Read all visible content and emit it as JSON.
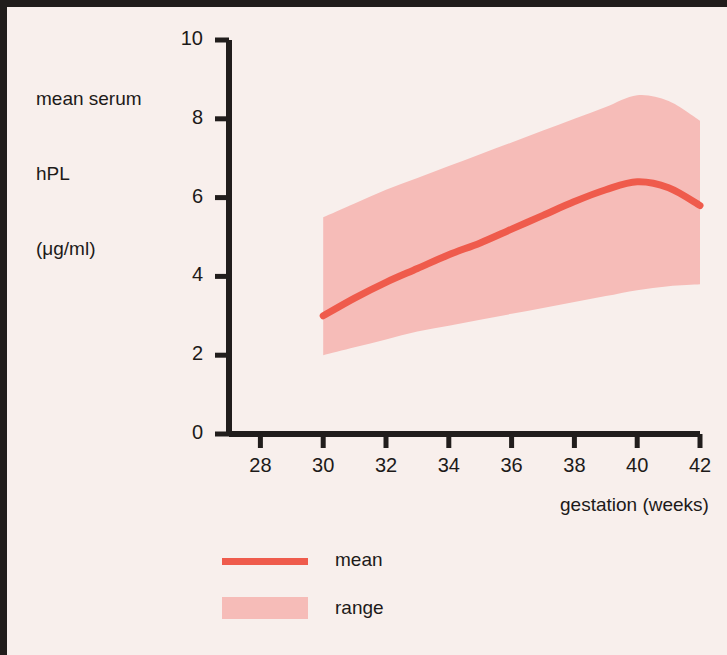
{
  "figure": {
    "background_color": "#f8efec",
    "border_color": "#211d1c"
  },
  "axes": {
    "y_title_line1": "mean serum",
    "y_title_line2": "hPL",
    "y_title_line3": "(μg/ml)",
    "x_title": "gestation (weeks)",
    "y_ticks": [
      "0",
      "2",
      "4",
      "6",
      "8",
      "10"
    ],
    "x_ticks": [
      "28",
      "30",
      "32",
      "34",
      "36",
      "38",
      "40",
      "42"
    ]
  },
  "legend": {
    "mean_label": "mean",
    "range_label": "range",
    "mean_color": "#ef5b4c",
    "range_color": "#f6bcb8"
  },
  "chart_data": {
    "type": "line",
    "title": "",
    "subtitle": "",
    "xlabel": "gestation (weeks)",
    "ylabel": "mean serum hPL (μg/ml)",
    "xlim": [
      27,
      42
    ],
    "ylim": [
      0,
      10
    ],
    "xticks": [
      28,
      30,
      32,
      34,
      36,
      38,
      40,
      42
    ],
    "yticks": [
      0,
      2,
      4,
      6,
      8,
      10
    ],
    "grid": false,
    "legend_position": "below-axes-left",
    "x": [
      30,
      31,
      32,
      33,
      34,
      35,
      36,
      37,
      38,
      39,
      40,
      41,
      42
    ],
    "series": [
      {
        "name": "mean",
        "color": "#ef5b4c",
        "type": "line",
        "values": [
          3.0,
          3.45,
          3.85,
          4.2,
          4.55,
          4.85,
          5.2,
          5.55,
          5.9,
          6.2,
          6.4,
          6.25,
          5.8
        ]
      },
      {
        "name": "range",
        "color": "#f6bcb8",
        "type": "band",
        "upper": [
          5.5,
          5.85,
          6.2,
          6.5,
          6.8,
          7.1,
          7.4,
          7.7,
          8.0,
          8.3,
          8.6,
          8.45,
          7.95
        ],
        "lower": [
          2.0,
          2.2,
          2.4,
          2.6,
          2.75,
          2.9,
          3.05,
          3.2,
          3.35,
          3.5,
          3.65,
          3.75,
          3.8
        ]
      }
    ]
  }
}
